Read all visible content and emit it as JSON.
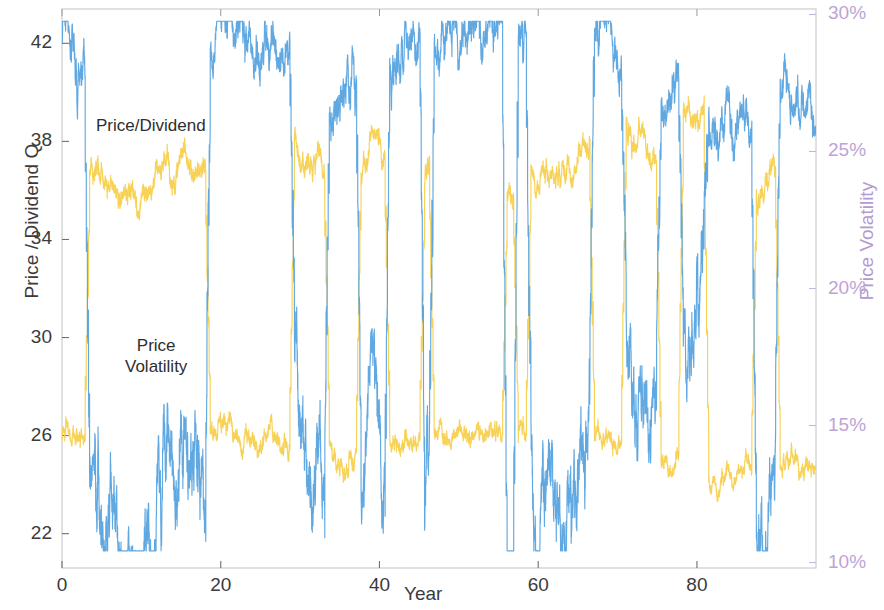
{
  "chart_data": {
    "type": "line",
    "title": "",
    "xlabel": "Year",
    "ylabel": "Price / Dividend Q",
    "y2label": "Price Volatility",
    "xlim": [
      0,
      95
    ],
    "ylim": [
      20.6,
      43.4
    ],
    "y2lim": [
      0.098,
      0.302
    ],
    "xticks": [
      0,
      20,
      40,
      60,
      80
    ],
    "xticklabels": [
      "0",
      "20",
      "40",
      "60",
      "80"
    ],
    "yticks": [
      22,
      26,
      30,
      34,
      38,
      42
    ],
    "yticklabels": [
      "22",
      "26",
      "30",
      "34",
      "38",
      "42"
    ],
    "y2ticks": [
      0.1,
      0.15,
      0.2,
      0.25,
      0.3
    ],
    "y2ticklabels": [
      "10%",
      "15%",
      "20%",
      "25%",
      "30%"
    ],
    "grid": false,
    "legend_position": "inline-annotations",
    "annotations": [
      {
        "text": "Price/Dividend",
        "x": 4.2,
        "y": 38.9
      },
      {
        "text": "Price\nVolatility",
        "x": 8.5,
        "y": 31.1
      }
    ],
    "series": [
      {
        "name": "Price/Dividend",
        "color": "#4F9FDE",
        "axis": "left",
        "description": "Regime-switching process oscillating between a high plateau near 41-42.7 and deep excursions down to 21.5; high-frequency noisy daily sampling."
      },
      {
        "name": "Price Volatility",
        "color": "#F6CE48",
        "axis": "right",
        "description": "Anti-correlated regime-switching volatility, low plateau near 13-16% with spikes up to 28-29%; high-frequency noisy daily sampling."
      }
    ],
    "regimes": {
      "description": "Approximate year intervals where the Price/Dividend series is in its LOW (crisis) state and Price Volatility is HIGH.",
      "low_pd_intervals": [
        [
          3.2,
          18.4
        ],
        [
          29.0,
          33.4
        ],
        [
          37.4,
          41.0
        ],
        [
          45.4,
          46.6
        ],
        [
          55.8,
          57.2
        ],
        [
          58.8,
          66.8
        ],
        [
          70.8,
          75.2
        ],
        [
          78.0,
          81.2
        ],
        [
          87.2,
          90.2
        ]
      ]
    }
  },
  "axes": {
    "left_label": "Price / Dividend Q",
    "right_label": "Price Volatility",
    "x_label": "Year"
  },
  "colors": {
    "price_dividend": "#4F9FDE",
    "price_volatility": "#F6CE48",
    "left_axis_text": "#3b3b3b",
    "right_axis_text": "#bda4d6",
    "box": "#c8c8c8",
    "background": "#ffffff"
  }
}
